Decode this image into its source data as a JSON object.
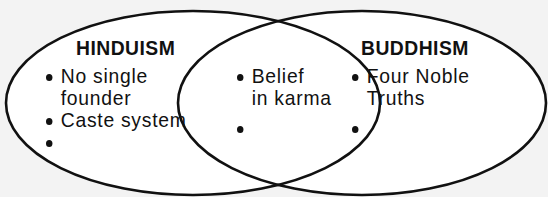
{
  "diagram": {
    "type": "venn",
    "colors": {
      "background": "#f3f3f3",
      "fill": "#ffffff",
      "stroke": "#111111"
    },
    "sets": [
      {
        "id": "hinduism",
        "title": "HINDUISM",
        "items": [
          "No single\nfounder",
          "Caste system",
          ""
        ]
      },
      {
        "id": "buddhism",
        "title": "BUDDHISM",
        "items": [
          "Four Noble\nTruths",
          ""
        ]
      }
    ],
    "overlap": {
      "items": [
        "Belief\nin karma",
        ""
      ]
    }
  }
}
